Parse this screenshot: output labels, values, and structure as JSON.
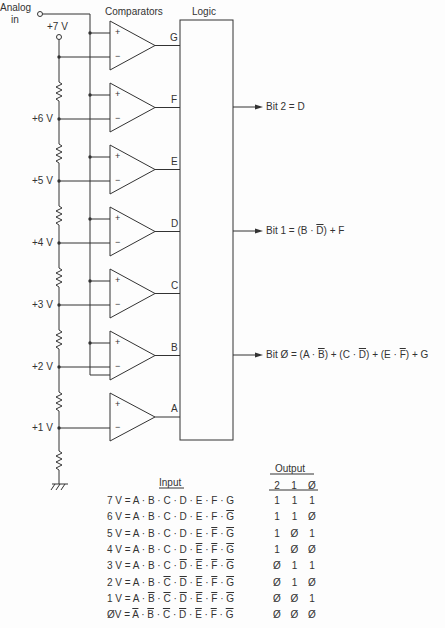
{
  "diagram": {
    "analog_in_label": [
      "Analog",
      "in"
    ],
    "comparators_title": "Comparators",
    "logic_title": "Logic",
    "ref_voltages": [
      "+7 V",
      "+6 V",
      "+5 V",
      "+4 V",
      "+3 V",
      "+2 V",
      "+1 V"
    ],
    "comparator_outputs": [
      "G",
      "F",
      "E",
      "D",
      "C",
      "B",
      "A"
    ],
    "plus_sign": "+",
    "minus_sign": "−",
    "bit_outputs": [
      {
        "label": "Bit 2 = D"
      },
      {
        "label_parts": [
          "Bit 1 = (B · ",
          "D",
          ") + F"
        ],
        "overline_index": [
          1
        ]
      },
      {
        "label_parts": [
          "Bit Ø = (A · ",
          "B",
          ") + (C · ",
          "D",
          ") + (E · ",
          "F",
          ") + G"
        ],
        "overline_index": [
          1,
          3,
          5
        ]
      }
    ],
    "colors": {
      "line": "#333333",
      "background": "#fdfdfd"
    }
  },
  "truth_table": {
    "input_header": "Input",
    "output_header": "Output",
    "output_columns": [
      "2",
      "1",
      "Ø"
    ],
    "rows": [
      {
        "voltage": "7 V",
        "terms": [
          "A",
          "B",
          "C",
          "D",
          "E",
          "F",
          "G"
        ],
        "bar": [
          0,
          0,
          0,
          0,
          0,
          0,
          0
        ],
        "out": [
          "1",
          "1",
          "1"
        ]
      },
      {
        "voltage": "6 V",
        "terms": [
          "A",
          "B",
          "C",
          "D",
          "E",
          "F",
          "G"
        ],
        "bar": [
          0,
          0,
          0,
          0,
          0,
          0,
          1
        ],
        "out": [
          "1",
          "1",
          "Ø"
        ]
      },
      {
        "voltage": "5 V",
        "terms": [
          "A",
          "B",
          "C",
          "D",
          "E",
          "F",
          "G"
        ],
        "bar": [
          0,
          0,
          0,
          0,
          0,
          1,
          1
        ],
        "out": [
          "1",
          "Ø",
          "1"
        ]
      },
      {
        "voltage": "4 V",
        "terms": [
          "A",
          "B",
          "C",
          "D",
          "E",
          "F",
          "G"
        ],
        "bar": [
          0,
          0,
          0,
          0,
          1,
          1,
          1
        ],
        "out": [
          "1",
          "Ø",
          "Ø"
        ]
      },
      {
        "voltage": "3 V",
        "terms": [
          "A",
          "B",
          "C",
          "D",
          "E",
          "F",
          "G"
        ],
        "bar": [
          0,
          0,
          0,
          1,
          1,
          1,
          1
        ],
        "out": [
          "Ø",
          "1",
          "1"
        ]
      },
      {
        "voltage": "2 V",
        "terms": [
          "A",
          "B",
          "C",
          "D",
          "E",
          "F",
          "G"
        ],
        "bar": [
          0,
          0,
          1,
          1,
          1,
          1,
          1
        ],
        "out": [
          "Ø",
          "1",
          "Ø"
        ]
      },
      {
        "voltage": "1 V",
        "terms": [
          "A",
          "B",
          "C",
          "D",
          "E",
          "F",
          "G"
        ],
        "bar": [
          0,
          1,
          1,
          1,
          1,
          1,
          1
        ],
        "out": [
          "Ø",
          "Ø",
          "1"
        ]
      },
      {
        "voltage": "ØV",
        "terms": [
          "A",
          "B",
          "C",
          "D",
          "E",
          "F",
          "G"
        ],
        "bar": [
          1,
          1,
          1,
          1,
          1,
          1,
          1
        ],
        "out": [
          "Ø",
          "Ø",
          "Ø"
        ]
      }
    ]
  }
}
